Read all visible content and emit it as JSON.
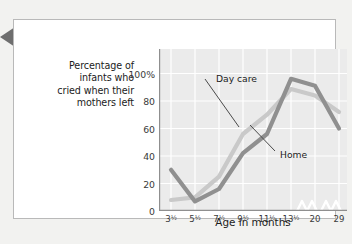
{
  "figure": {
    "marker_icon": "left-pointing-triangle-icon",
    "marker_color": "#6e6e6e",
    "card_background": "#ffffff",
    "page_background": "#f2f2f0"
  },
  "chart_data": {
    "type": "line",
    "title": "",
    "ylabel": "Percentage of infants who cried when their mothers left",
    "ylabel_lines": [
      "Percentage of",
      "infants who",
      "cried when their",
      "mothers left"
    ],
    "xlabel": "Age in months",
    "categories": [
      "3½",
      "5½",
      "7½",
      "9½",
      "11½",
      "13½",
      "20",
      "29"
    ],
    "x_tick_labels": [
      {
        "base": "3",
        "frac": "½"
      },
      {
        "base": "5",
        "frac": "½"
      },
      {
        "base": "7",
        "frac": "½"
      },
      {
        "base": "9",
        "frac": "½"
      },
      {
        "base": "11",
        "frac": "½"
      },
      {
        "base": "13",
        "frac": "½"
      },
      {
        "base": "20",
        "frac": ""
      },
      {
        "base": "29",
        "frac": ""
      }
    ],
    "y_tick_labels": [
      "0",
      "20",
      "40",
      "60",
      "80",
      "100%"
    ],
    "y_tick_values": [
      0,
      20,
      40,
      60,
      80,
      100
    ],
    "ylim": [
      0,
      118
    ],
    "grid": true,
    "grid_color": "#ffffff",
    "plot_background": "#ebebeb",
    "legend_position": "inline-annotations",
    "axis_breaks": [
      "between 13½ and 20",
      "between 20 and 29"
    ],
    "series": [
      {
        "name": "Day care",
        "color": "#c9c9c9",
        "values": [
          8,
          10,
          25,
          56,
          70,
          86,
          84,
          72
        ],
        "label_text": "Day care"
      },
      {
        "name": "Home",
        "color": "#909090",
        "values": [
          30,
          7,
          16,
          42,
          56,
          96,
          91,
          60
        ],
        "label_text": "Home"
      }
    ]
  }
}
